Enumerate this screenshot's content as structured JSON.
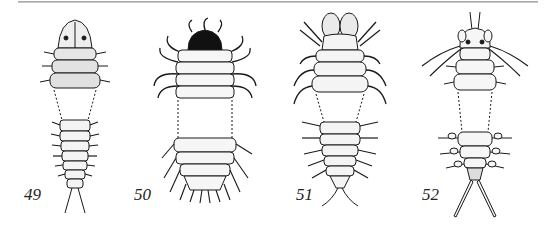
{
  "plate": {
    "figures": [
      {
        "number": "49",
        "description": "larva, dorsal view, head with eyespots, three thoracic segments, tapered abdomen with two cerci"
      },
      {
        "number": "50",
        "description": "larva, dorsal view, black head, curled filamentous gills along thorax and abdomen"
      },
      {
        "number": "51",
        "description": "larva, dorsal view, large bilobed head appendages, spined legs, tapered abdomen"
      },
      {
        "number": "52",
        "description": "larva, dorsal view, horned head with long antennae, lateral gills, two long cerci"
      }
    ]
  },
  "colors": {
    "ink": "#1a1a1a",
    "stipple": "#555555",
    "paper": "#ffffff",
    "rule": "#a0a0a0"
  }
}
